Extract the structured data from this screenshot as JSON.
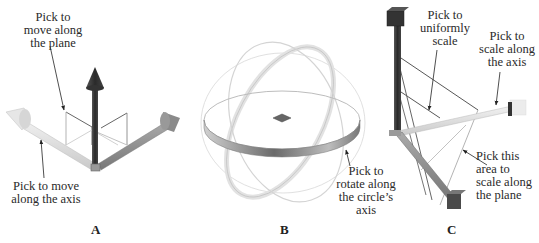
{
  "figure": {
    "panels": [
      {
        "letter": "A",
        "gizmo": "translate",
        "callouts": {
          "plane": "Pick to\nmove along\nthe plane",
          "axis": "Pick to move\nalong the axis"
        }
      },
      {
        "letter": "B",
        "gizmo": "rotate",
        "callouts": {
          "ring": "Pick to\nrotate along\nthe circle’s\naxis"
        }
      },
      {
        "letter": "C",
        "gizmo": "scale",
        "callouts": {
          "uniform": "Pick to\nuniformly\nscale",
          "axis": "Pick to\nscale along\nthe axis",
          "plane": "Pick this\narea to\nscale along\nthe plane"
        }
      }
    ],
    "colors": {
      "axis_dark": "#3a3a3a",
      "axis_mid": "#8a8a8a",
      "axis_light": "#d8d8d8",
      "leader": "#333333"
    }
  }
}
